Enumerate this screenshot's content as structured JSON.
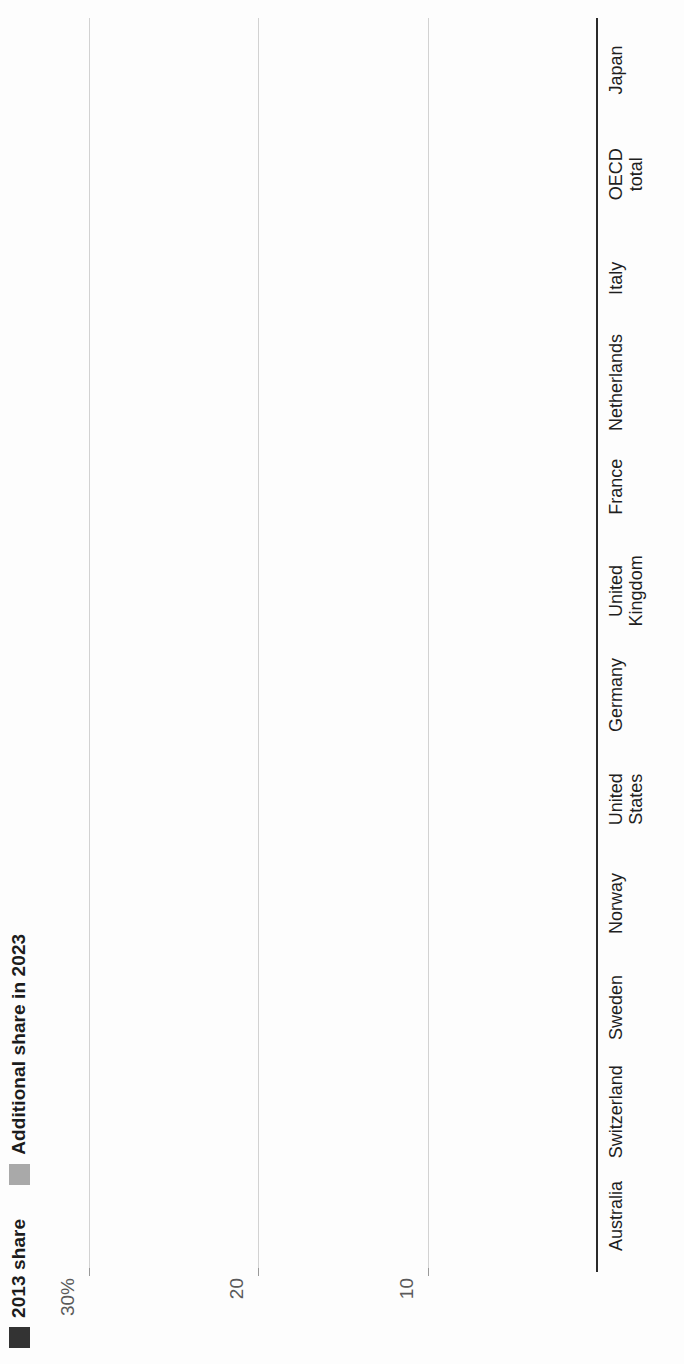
{
  "chart_data": {
    "type": "bar",
    "subtype": "stacked-vertical",
    "title": "",
    "xlabel": "",
    "ylabel": "",
    "ylim": [
      0,
      32
    ],
    "grid": true,
    "legend_position": "top-left",
    "y_ticks": [
      {
        "value": 30,
        "label": "30%"
      },
      {
        "value": 20,
        "label": "20"
      },
      {
        "value": 10,
        "label": "10"
      }
    ],
    "categories": [
      "Australia",
      "Switzerland",
      "Sweden",
      "Norway",
      "United\nStates",
      "Germany",
      "United\nKingdom",
      "France",
      "Netherlands",
      "Italy",
      "OECD\ntotal",
      "Japan"
    ],
    "series": [
      {
        "name": "2013 share",
        "color": "#333333",
        "values": [
          28.8,
          28.5,
          20.0,
          15.8,
          13.6,
          14.4,
          12.7,
          11.7,
          11.0,
          8.8,
          8.8,
          1.6
        ]
      },
      {
        "name": "Additional share in 2023",
        "color": "#a9a9a9",
        "values": [
          1.5,
          2.5,
          3.0,
          3.3,
          2.3,
          3.6,
          2.5,
          2.4,
          4.9,
          1.6,
          1.7,
          0.7
        ]
      }
    ],
    "totals": [
      30.3,
      31.0,
      23.0,
      19.1,
      15.9,
      18.0,
      15.2,
      14.1,
      15.9,
      10.4,
      10.5,
      2.3
    ]
  },
  "legend": {
    "items": [
      {
        "label": "2013 share",
        "swatch": "dark"
      },
      {
        "label": "Additional share in 2023",
        "swatch": "light"
      }
    ]
  },
  "colors": {
    "base": "#333333",
    "additional": "#a9a9a9",
    "grid": "#d2d2d2",
    "axis": "#2b2b2b",
    "tick_text": "#5a5a5a",
    "label_text": "#1f1f1f"
  }
}
